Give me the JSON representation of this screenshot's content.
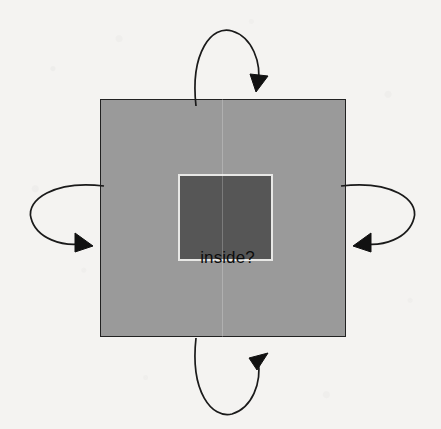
{
  "figure": {
    "background_color": "#f4f3f1",
    "labels": {
      "outside": "outside?",
      "inside": "inside?"
    },
    "outer_region": {
      "name": "outer square",
      "fill_color": "#9a9a9a",
      "border_color": "#222222",
      "x": 100,
      "y": 99,
      "width": 246,
      "height": 238
    },
    "inner_region": {
      "name": "inner square",
      "fill_color": "#565656",
      "border_color": "#e8e8e6",
      "x": 177,
      "y": 173,
      "width": 95,
      "height": 87
    },
    "arrows": [
      {
        "name": "top-arrow",
        "direction": "over-the-top-pointing-down-into-square",
        "color": "#1a1a1a"
      },
      {
        "name": "right-arrow",
        "direction": "around-the-right-pointing-left-into-square",
        "color": "#1a1a1a"
      },
      {
        "name": "bottom-arrow",
        "direction": "under-the-bottom-pointing-up-into-square",
        "color": "#1a1a1a"
      },
      {
        "name": "left-arrow",
        "direction": "around-the-left-pointing-right-into-square",
        "color": "#1a1a1a"
      }
    ]
  }
}
